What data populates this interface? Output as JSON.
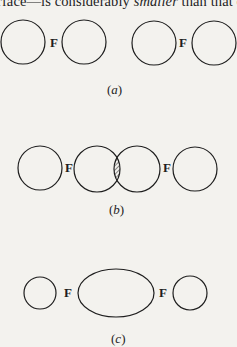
{
  "top_text": {
    "before": "rface—is considerably ",
    "emphasis": "smaller",
    "after": " than that of"
  },
  "panels": [
    {
      "id": "a",
      "caption_letter": "a",
      "force_label": "F",
      "description": "Two pairs of separated circles, each pair with force F between them"
    },
    {
      "id": "b",
      "caption_letter": "b",
      "force_label": "F",
      "description": "Two middle circles overlap with hatched lens-shaped overlap region; outer circles with force F"
    },
    {
      "id": "c",
      "caption_letter": "c",
      "force_label": "F",
      "description": "Middle circles merged into an ellipse; smaller outer circles with force F"
    }
  ],
  "colors": {
    "background": "#f3f2ee",
    "stroke": "#1e1e1e"
  }
}
